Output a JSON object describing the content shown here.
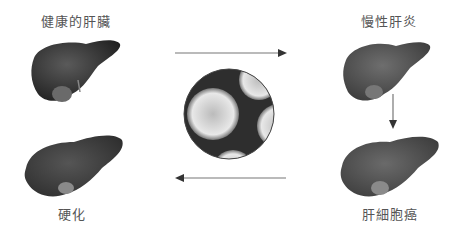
{
  "diagram": {
    "stages": [
      {
        "id": "healthy",
        "label": "健康的肝臟"
      },
      {
        "id": "chronic_hepatitis",
        "label": "慢性肝炎"
      },
      {
        "id": "hcc",
        "label": "肝細胞癌"
      },
      {
        "id": "cirrhosis",
        "label": "硬化"
      }
    ],
    "center_image": "virus-micrograph",
    "arrows": [
      {
        "from": "healthy",
        "to": "chronic_hepatitis",
        "direction": "right"
      },
      {
        "from": "chronic_hepatitis",
        "to": "hcc",
        "direction": "down"
      },
      {
        "from": "hcc",
        "to": "cirrhosis",
        "direction": "left"
      }
    ],
    "colors": {
      "text": "#555555",
      "arrow": "#777777",
      "liver_dark": "#3a3a3a"
    }
  }
}
